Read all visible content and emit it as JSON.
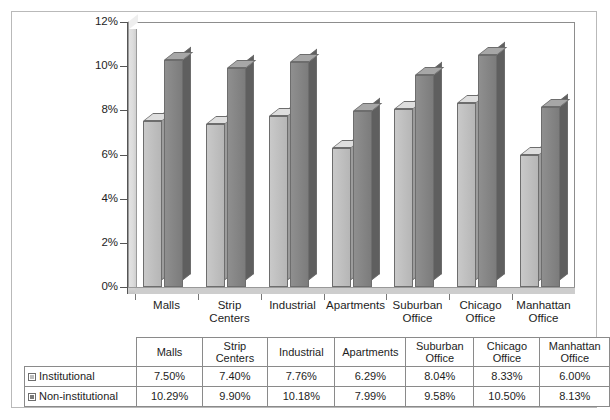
{
  "chart_data": {
    "type": "bar",
    "title": "",
    "xlabel": "",
    "ylabel": "",
    "ylim": [
      0,
      12
    ],
    "ytick_labels": [
      "12%",
      "10%",
      "8%",
      "6%",
      "4%",
      "2%",
      "0%"
    ],
    "ytick_values": [
      12,
      10,
      8,
      6,
      4,
      2,
      0
    ],
    "grid": false,
    "legend_position": "table-row-labels",
    "categories": [
      "Malls",
      "Strip Centers",
      "Industrial",
      "Apartments",
      "Suburban Office",
      "Chicago Office",
      "Manhattan Office"
    ],
    "series": [
      {
        "name": "Institutional",
        "color": "#bdbdbd",
        "values": [
          7.5,
          7.4,
          7.76,
          6.29,
          8.04,
          8.33,
          6.0
        ],
        "labels": [
          "7.50%",
          "7.40%",
          "7.76%",
          "6.29%",
          "8.04%",
          "8.33%",
          "6.00%"
        ]
      },
      {
        "name": "Non-institutional",
        "color": "#7a7a7a",
        "values": [
          10.29,
          9.9,
          10.18,
          7.99,
          9.58,
          10.5,
          8.13
        ],
        "labels": [
          "10.29%",
          "9.90%",
          "10.18%",
          "7.99%",
          "9.58%",
          "10.50%",
          "8.13%"
        ]
      }
    ]
  },
  "axis": {
    "ticks": [
      {
        "label": "12%"
      },
      {
        "label": "10%"
      },
      {
        "label": "8%"
      },
      {
        "label": "6%"
      },
      {
        "label": "4%"
      },
      {
        "label": "2%"
      },
      {
        "label": "0%"
      }
    ]
  },
  "categories": [
    {
      "line1": "Malls",
      "line2": ""
    },
    {
      "line1": "Strip",
      "line2": "Centers"
    },
    {
      "line1": "Industrial",
      "line2": ""
    },
    {
      "line1": "Apartments",
      "line2": ""
    },
    {
      "line1": "Suburban",
      "line2": "Office"
    },
    {
      "line1": "Chicago",
      "line2": "Office"
    },
    {
      "line1": "Manhattan",
      "line2": "Office"
    }
  ],
  "table": {
    "headers": [
      {
        "line1": "Malls",
        "line2": ""
      },
      {
        "line1": "Strip",
        "line2": "Centers"
      },
      {
        "line1": "Industrial",
        "line2": ""
      },
      {
        "line1": "Apartments",
        "line2": ""
      },
      {
        "line1": "Suburban",
        "line2": "Office"
      },
      {
        "line1": "Chicago",
        "line2": "Office"
      },
      {
        "line1": "Manhattan",
        "line2": "Office"
      }
    ],
    "rows": [
      {
        "label": "Institutional",
        "swatch": "institutional-swatch",
        "cells": [
          "7.50%",
          "7.40%",
          "7.76%",
          "6.29%",
          "8.04%",
          "8.33%",
          "6.00%"
        ]
      },
      {
        "label": "Non-institutional",
        "swatch": "non-institutional-swatch",
        "cells": [
          "10.29%",
          "9.90%",
          "10.18%",
          "7.99%",
          "9.58%",
          "10.50%",
          "8.13%"
        ]
      }
    ]
  },
  "colors": {
    "institutional": "#bdbdbd",
    "non_institutional": "#7a7a7a",
    "frame": "#b9b9b9",
    "gridline": "#8d8d8d"
  }
}
